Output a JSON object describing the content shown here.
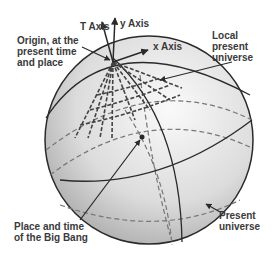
{
  "diagram": {
    "type": "spacetime-sphere",
    "labels": {
      "t_axis": "T Axis",
      "y_axis": "y Axis",
      "x_axis": "x Axis",
      "origin": "Origin, at the\npresent time\nand place",
      "local_present_universe": "Local\npresent\nuniverse",
      "big_bang": "Place and time\nof the Big Bang",
      "present_universe": "Present\nuniverse"
    },
    "colors": {
      "line": "#2a2a2a",
      "dashed": "#777777",
      "sphere_light": "#f2f2f2",
      "sphere_dark": "#a8a8a8",
      "text": "#3a3a3a"
    }
  }
}
